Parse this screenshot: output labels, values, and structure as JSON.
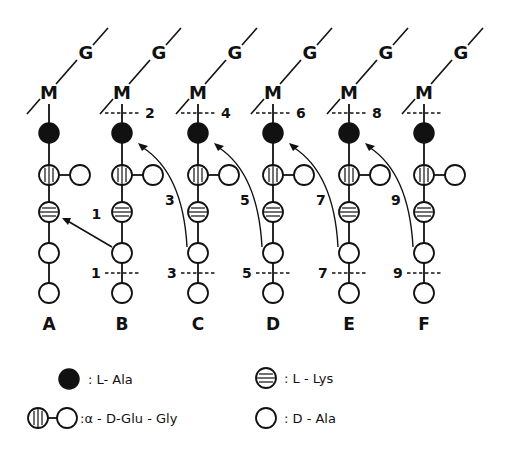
{
  "figure": {
    "columns": [
      {
        "id": "A",
        "label": "A",
        "x": 49,
        "top_cut": null,
        "bottom_cut": null,
        "arrow": null
      },
      {
        "id": "B",
        "label": "B",
        "x": 122,
        "top_cut": "2",
        "bottom_cut": "1",
        "arrow": {
          "label": "1",
          "target": "A-lys"
        }
      },
      {
        "id": "C",
        "label": "C",
        "x": 198,
        "top_cut": "4",
        "bottom_cut": "3",
        "arrow": {
          "label": "3",
          "target": "B-ala"
        }
      },
      {
        "id": "D",
        "label": "D",
        "x": 273,
        "top_cut": "6",
        "bottom_cut": "5",
        "arrow": {
          "label": "5",
          "target": "C-ala"
        }
      },
      {
        "id": "E",
        "label": "E",
        "x": 349,
        "top_cut": "8",
        "bottom_cut": "7",
        "arrow": {
          "label": "7",
          "target": "D-ala"
        }
      },
      {
        "id": "F",
        "label": "F",
        "x": 424,
        "top_cut": "",
        "bottom_cut": "9",
        "arrow": {
          "label": "9",
          "target": "E-ala"
        }
      }
    ],
    "glycan": {
      "m_label": "M",
      "g_label": "G"
    }
  },
  "legend": {
    "items": [
      {
        "symbol": "filled-circle",
        "text": ": L- Ala"
      },
      {
        "symbol": "horizontal-striped-circle",
        "text": ": L - Lys"
      },
      {
        "symbol": "vertical-striped-circle-with-branch",
        "text": ":α - D-Glu - Gly"
      },
      {
        "symbol": "open-circle",
        "text": ": D - Ala"
      }
    ]
  },
  "colors": {
    "ink": "#111111",
    "background": "#ffffff"
  }
}
